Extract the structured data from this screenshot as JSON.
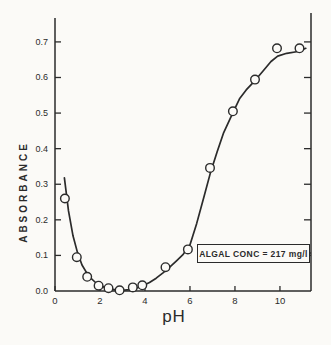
{
  "figure": {
    "background": "#fbfaf7",
    "ink": "#2b2b2b",
    "marker_fill": "#fcfbf8"
  },
  "chart_data": {
    "type": "scatter",
    "title": "",
    "xlabel": "pH",
    "ylabel": "ABSORBANCE",
    "xlim": [
      0,
      11.38
    ],
    "ylim": [
      0,
      0.77
    ],
    "grid": false,
    "legend": "none",
    "marker": "open-circle",
    "x_ticks": [
      0,
      2,
      4,
      6,
      8,
      10
    ],
    "x_tick_labels": [
      "0",
      "2",
      "4",
      "6",
      "8",
      "10"
    ],
    "y_ticks": [
      0.0,
      0.1,
      0.2,
      0.3,
      0.4,
      0.5,
      0.6,
      0.7
    ],
    "y_tick_labels": [
      "0.0",
      "0.1",
      "0.2",
      "0.3",
      "0.4",
      "0.5",
      "0.6",
      "0.7"
    ],
    "points": [
      [
        0.44,
        0.26
      ],
      [
        0.97,
        0.095
      ],
      [
        1.43,
        0.04
      ],
      [
        1.94,
        0.015
      ],
      [
        2.38,
        0.008
      ],
      [
        2.87,
        0.002
      ],
      [
        3.46,
        0.01
      ],
      [
        3.88,
        0.016
      ],
      [
        4.91,
        0.067
      ],
      [
        5.91,
        0.117
      ],
      [
        6.89,
        0.346
      ],
      [
        7.91,
        0.505
      ],
      [
        8.89,
        0.594
      ],
      [
        9.87,
        0.682
      ],
      [
        10.87,
        0.682
      ]
    ],
    "fit_curve": [
      [
        0.42,
        0.318
      ],
      [
        0.6,
        0.225
      ],
      [
        0.8,
        0.155
      ],
      [
        1.0,
        0.108
      ],
      [
        1.2,
        0.073
      ],
      [
        1.5,
        0.042
      ],
      [
        1.8,
        0.024
      ],
      [
        2.1,
        0.013
      ],
      [
        2.4,
        0.006
      ],
      [
        2.7,
        0.003
      ],
      [
        3.0,
        0.002
      ],
      [
        3.3,
        0.004
      ],
      [
        3.6,
        0.008
      ],
      [
        3.9,
        0.015
      ],
      [
        4.2,
        0.024
      ],
      [
        4.5,
        0.036
      ],
      [
        4.8,
        0.051
      ],
      [
        5.1,
        0.067
      ],
      [
        5.4,
        0.085
      ],
      [
        5.7,
        0.103
      ],
      [
        6.0,
        0.13
      ],
      [
        6.3,
        0.19
      ],
      [
        6.6,
        0.26
      ],
      [
        6.9,
        0.33
      ],
      [
        7.2,
        0.39
      ],
      [
        7.5,
        0.445
      ],
      [
        7.9,
        0.5
      ],
      [
        8.2,
        0.54
      ],
      [
        8.5,
        0.565
      ],
      [
        8.9,
        0.592
      ],
      [
        9.2,
        0.615
      ],
      [
        9.6,
        0.645
      ],
      [
        9.9,
        0.66
      ],
      [
        10.3,
        0.668
      ],
      [
        10.8,
        0.673
      ],
      [
        11.15,
        0.682
      ]
    ],
    "annotation": {
      "text": "ALGAL CONC = 217 mg/l"
    }
  }
}
